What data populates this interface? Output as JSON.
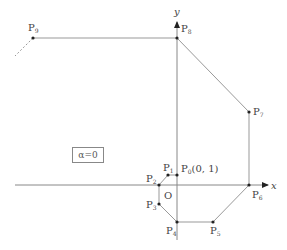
{
  "diagram": {
    "type": "spiral-path-on-axes",
    "axes": {
      "x_label": "x",
      "y_label": "y",
      "origin_label": "O"
    },
    "parameter_box": "α=0",
    "points": [
      {
        "name": "P0",
        "label": "P",
        "sub": "0",
        "extra": "(0, 1)",
        "px": [
          177,
          175
        ]
      },
      {
        "name": "P1",
        "label": "P",
        "sub": "1",
        "extra": "",
        "px": [
          168,
          175
        ]
      },
      {
        "name": "P2",
        "label": "P",
        "sub": "2",
        "extra": "",
        "px": [
          159,
          185
        ]
      },
      {
        "name": "P3",
        "label": "P",
        "sub": "3",
        "extra": "",
        "px": [
          159,
          204
        ]
      },
      {
        "name": "P4",
        "label": "P",
        "sub": "4",
        "extra": "",
        "px": [
          177,
          222
        ]
      },
      {
        "name": "P5",
        "label": "P",
        "sub": "5",
        "extra": "",
        "px": [
          213,
          222
        ]
      },
      {
        "name": "P6",
        "label": "P",
        "sub": "6",
        "extra": "",
        "px": [
          249,
          185
        ]
      },
      {
        "name": "P7",
        "label": "P",
        "sub": "7",
        "extra": "",
        "px": [
          249,
          112
        ]
      },
      {
        "name": "P8",
        "label": "P",
        "sub": "8",
        "extra": "",
        "px": [
          177,
          38
        ]
      },
      {
        "name": "P9",
        "label": "P",
        "sub": "9",
        "extra": "",
        "px": [
          33,
          38
        ]
      }
    ],
    "continuation": "dashed line from P9 toward lower-left"
  },
  "colors": {
    "line": "#999999",
    "axis": "#888888",
    "point": "#222222",
    "text": "#444444"
  }
}
